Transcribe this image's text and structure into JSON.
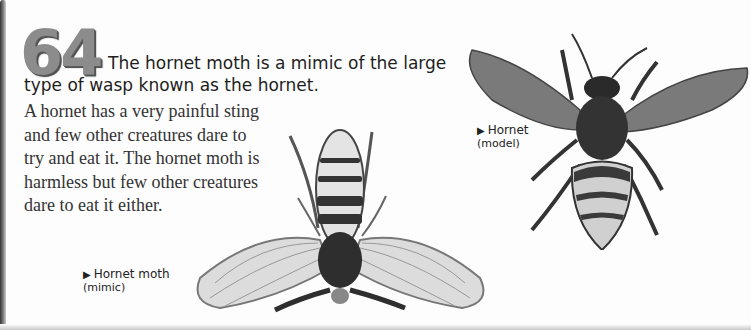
{
  "page": {
    "fact_number": "64",
    "heading": "The hornet moth is a mimic of the large type of wasp known as the hornet.",
    "body": "A hornet has a very painful sting and few other creatures dare to try and eat it. The hornet moth is harmless but few other creatures dare to eat it either.",
    "colors": {
      "number": "#8c8c8c",
      "text": "#2a2a2a",
      "background": "#fdfdfd"
    }
  },
  "captions": {
    "moth": {
      "arrow": "▶",
      "title": "Hornet moth",
      "subtitle": "(mimic)"
    },
    "hornet": {
      "arrow": "▶",
      "title": "Hornet",
      "subtitle": "(model)"
    }
  },
  "illustrations": {
    "moth": "hornet-moth-illustration",
    "hornet": "hornet-illustration"
  }
}
